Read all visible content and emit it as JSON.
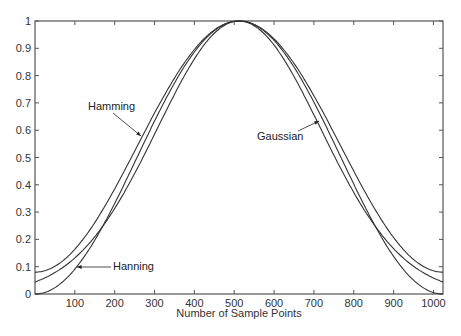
{
  "chart_data": {
    "type": "line",
    "title": "",
    "xlabel": "Number of Sample Points",
    "ylabel": "",
    "xlim": [
      0,
      1024
    ],
    "ylim": [
      0,
      1
    ],
    "grid": false,
    "legend": "none (inline annotations with arrows)",
    "x_ticks": [
      100,
      200,
      300,
      400,
      500,
      600,
      700,
      800,
      900,
      1000
    ],
    "y_ticks": [
      0,
      0.1,
      0.2,
      0.3,
      0.4,
      0.5,
      0.6,
      0.7,
      0.8,
      0.9,
      1
    ],
    "x_tick_labels": [
      "100",
      "200",
      "300",
      "400",
      "500",
      "600",
      "700",
      "800",
      "900",
      "1000"
    ],
    "y_tick_labels": [
      "0",
      "0.1",
      "0.2",
      "0.3",
      "0.4",
      "0.5",
      "0.6",
      "0.7",
      "0.8",
      "0.9",
      "1"
    ],
    "x": [
      0,
      64,
      128,
      192,
      256,
      320,
      384,
      448,
      512,
      576,
      640,
      704,
      768,
      832,
      896,
      960,
      1024
    ],
    "series": [
      {
        "name": "Hamming",
        "values": [
          0.08,
          0.115,
          0.215,
          0.364,
          0.54,
          0.716,
          0.865,
          0.965,
          1.0,
          0.965,
          0.865,
          0.716,
          0.54,
          0.364,
          0.215,
          0.115,
          0.08
        ]
      },
      {
        "name": "Hanning",
        "values": [
          0.0,
          0.038,
          0.146,
          0.309,
          0.5,
          0.691,
          0.854,
          0.962,
          1.0,
          0.962,
          0.854,
          0.691,
          0.5,
          0.309,
          0.146,
          0.038,
          0.0
        ]
      },
      {
        "name": "Gaussian",
        "values": [
          0.044,
          0.088,
          0.163,
          0.278,
          0.458,
          0.64,
          0.802,
          0.92,
          1.0,
          0.92,
          0.802,
          0.64,
          0.458,
          0.278,
          0.163,
          0.088,
          0.044
        ]
      }
    ],
    "annotations": [
      {
        "text": "Hamming",
        "points_to_x": 270
      },
      {
        "text": "Gaussian",
        "points_to_x": 720
      },
      {
        "text": "Hanning",
        "points_to_x": 110
      }
    ]
  },
  "labels": {
    "xlabel": "Number of Sample Points",
    "hamming": "Hamming",
    "gaussian": "Gaussian",
    "hanning": "Hanning"
  },
  "colors": {
    "axis": "#555555",
    "line": "#333333"
  }
}
